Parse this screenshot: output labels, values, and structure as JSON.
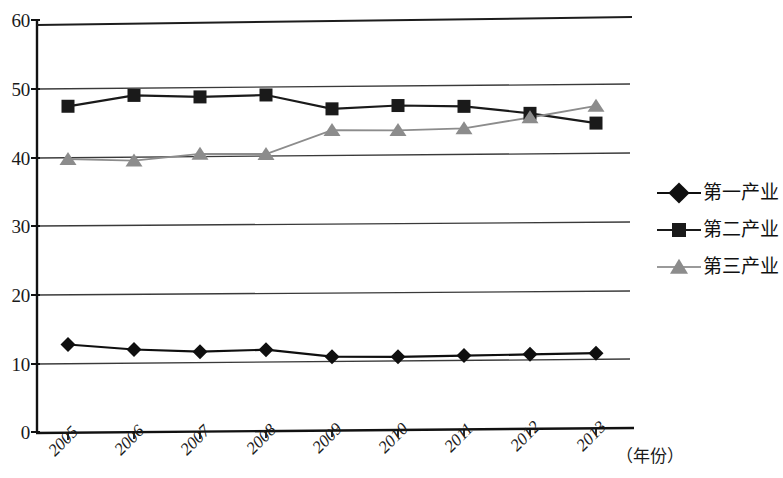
{
  "chart_data": {
    "type": "line",
    "title": "",
    "subtitle": "",
    "xlabel": "（年份）",
    "ylabel": "",
    "x": [
      "2005",
      "2006",
      "2007",
      "2008",
      "2009",
      "2010",
      "2011",
      "2012",
      "2013"
    ],
    "xtick_labels": [
      "2005",
      "2006",
      "2007",
      "2008",
      "2009",
      "2010",
      "2011",
      "2012",
      "2013"
    ],
    "ytick_labels": [
      "0",
      "10",
      "20",
      "30",
      "40",
      "50",
      "60"
    ],
    "yticks": [
      0,
      10,
      20,
      30,
      40,
      50,
      60
    ],
    "ylim": [
      0,
      60
    ],
    "grid": true,
    "grid_axis": "y",
    "legend_position": "right",
    "series": [
      {
        "name": "第一产业",
        "marker": "diamond",
        "color": "#0f0f0f",
        "values": [
          12.7,
          11.9,
          11.5,
          11.7,
          10.6,
          10.5,
          10.6,
          10.7,
          10.8
        ]
      },
      {
        "name": "第二产业",
        "marker": "square",
        "color": "#1a1a1a",
        "values": [
          47.4,
          48.9,
          48.6,
          48.8,
          46.7,
          47.1,
          46.9,
          45.8,
          44.3
        ]
      },
      {
        "name": "第三产业",
        "marker": "triangle",
        "color": "#8c8c8c",
        "values": [
          39.7,
          39.4,
          40.3,
          40.2,
          43.6,
          43.5,
          43.7,
          45.2,
          46.8
        ]
      }
    ]
  },
  "legend": {
    "items": [
      {
        "label": "第一产业",
        "marker": "diamond",
        "color": "#0f0f0f"
      },
      {
        "label": "第二产业",
        "marker": "square",
        "color": "#1a1a1a"
      },
      {
        "label": "第三产业",
        "marker": "triangle",
        "color": "#8c8c8c"
      }
    ]
  },
  "axes": {
    "y_tick_0": "0",
    "y_tick_10": "10",
    "y_tick_20": "20",
    "y_tick_30": "30",
    "y_tick_40": "40",
    "y_tick_50": "50",
    "y_tick_60": "60",
    "x_unit_label": "（年份）"
  },
  "colors": {
    "series1": "#0f0f0f",
    "series2": "#1a1a1a",
    "series3": "#8c8c8c",
    "axis": "#111111",
    "grid": "#3a3a3a",
    "background": "#ffffff"
  }
}
